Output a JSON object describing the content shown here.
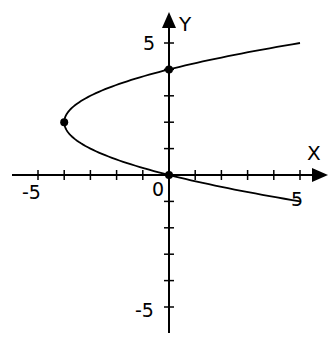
{
  "chart_data": {
    "type": "line",
    "title": "",
    "xlabel": "X",
    "ylabel": "Y",
    "xlim": [
      -6,
      6
    ],
    "ylim": [
      -6,
      6.2
    ],
    "grid": false,
    "x_tick_step": 1,
    "y_tick_step": 1,
    "tick_labels": {
      "x": [
        "-5",
        "0",
        "5"
      ],
      "y": [
        "5",
        "-5"
      ]
    },
    "series": [
      {
        "name": "x = y^2 - 4y",
        "equation": "x = (y - 2)^2 - 4",
        "y_range": [
          -1,
          5
        ],
        "color": "#000000"
      }
    ],
    "marked_points": [
      {
        "x": -4,
        "y": 2,
        "label": "vertex"
      },
      {
        "x": 0,
        "y": 0,
        "label": ""
      },
      {
        "x": 0,
        "y": 4,
        "label": ""
      }
    ]
  },
  "labels": {
    "x_axis": "X",
    "y_axis": "Y",
    "origin": "0",
    "x_neg5": "-5",
    "x_pos5": "5",
    "y_pos5": "5",
    "y_neg5": "-5"
  },
  "colors": {
    "background": "#ffffff",
    "ink": "#000000"
  }
}
